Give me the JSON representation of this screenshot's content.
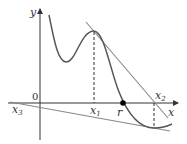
{
  "diagram": {
    "labels": {
      "y_axis": "y",
      "x_axis": "x",
      "origin": "0",
      "x1": "x",
      "x1_sub": "1",
      "x2": "x",
      "x2_sub": "2",
      "x3": "x",
      "x3_sub": "3",
      "root": "r"
    },
    "colors": {
      "curve": "#555555",
      "tangent": "#777777",
      "axis": "#333333",
      "dashed": "#333333"
    }
  }
}
